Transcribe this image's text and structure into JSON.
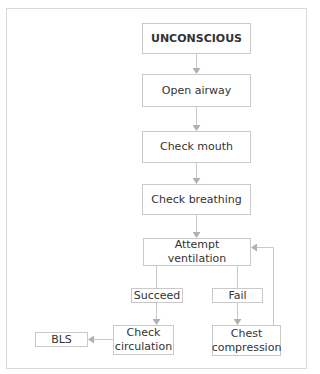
{
  "diagram": {
    "type": "flowchart",
    "nodes": {
      "unconscious": "UNCONSCIOUS",
      "open_airway": "Open airway",
      "check_mouth": "Check mouth",
      "check_breathing": "Check breathing",
      "attempt_ventilation": "Attempt ventilation",
      "check_circulation_line1": "Check",
      "check_circulation_line2": "circulation",
      "chest_compression_line1": "Chest",
      "chest_compression_line2": "compression",
      "bls": "BLS"
    },
    "edge_labels": {
      "succeed": "Succeed",
      "fail": "Fail"
    },
    "edges": [
      {
        "from": "UNCONSCIOUS",
        "to": "Open airway"
      },
      {
        "from": "Open airway",
        "to": "Check mouth"
      },
      {
        "from": "Check mouth",
        "to": "Check breathing"
      },
      {
        "from": "Check breathing",
        "to": "Attempt ventilation"
      },
      {
        "from": "Attempt ventilation",
        "to": "Check circulation",
        "label": "Succeed"
      },
      {
        "from": "Attempt ventilation",
        "to": "Chest compression",
        "label": "Fail"
      },
      {
        "from": "Chest compression",
        "to": "Attempt ventilation"
      },
      {
        "from": "Check circulation",
        "to": "BLS"
      }
    ],
    "colors": {
      "line": "#c8c8c8",
      "arrow": "#b0b0b0",
      "box_border": "#c9c9c9",
      "text": "#333333"
    }
  }
}
